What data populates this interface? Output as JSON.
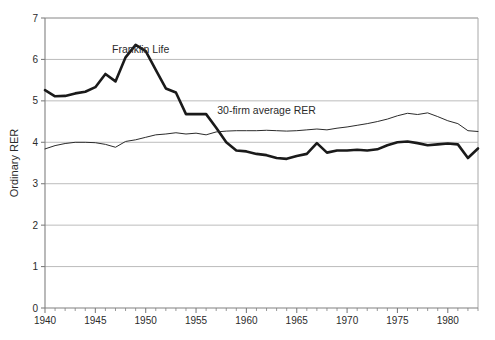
{
  "chart_data": {
    "type": "line",
    "title": "",
    "xlabel": "",
    "ylabel": "Ordinary RER",
    "xlim": [
      1940,
      1983
    ],
    "ylim": [
      0,
      7
    ],
    "grid": "horizontal",
    "legend_position": "inline-annotations",
    "xticks": [
      1940,
      1945,
      1950,
      1955,
      1960,
      1965,
      1970,
      1975,
      1980
    ],
    "yticks": [
      0,
      1,
      2,
      3,
      4,
      5,
      6,
      7
    ],
    "x": [
      1940,
      1941,
      1942,
      1943,
      1944,
      1945,
      1946,
      1947,
      1948,
      1949,
      1950,
      1951,
      1952,
      1953,
      1954,
      1955,
      1956,
      1957,
      1958,
      1959,
      1960,
      1961,
      1962,
      1963,
      1964,
      1965,
      1966,
      1967,
      1968,
      1969,
      1970,
      1971,
      1972,
      1973,
      1974,
      1975,
      1976,
      1977,
      1978,
      1979,
      1980,
      1981,
      1982,
      1983
    ],
    "series": [
      {
        "name": "Franklin Life",
        "label": "Franklin Life",
        "color": "#1a1a1a",
        "line_width": 2.6,
        "label_x": 1949.5,
        "label_y": 6.15,
        "values": [
          5.26,
          5.11,
          5.12,
          5.18,
          5.22,
          5.33,
          5.65,
          5.47,
          6.05,
          6.35,
          6.2,
          5.75,
          5.3,
          5.2,
          4.68,
          4.68,
          4.68,
          4.35,
          4.0,
          3.8,
          3.78,
          3.72,
          3.69,
          3.62,
          3.6,
          3.67,
          3.72,
          3.98,
          3.75,
          3.8,
          3.8,
          3.82,
          3.8,
          3.83,
          3.93,
          4.0,
          4.02,
          3.98,
          3.93,
          3.95,
          3.97,
          3.95,
          3.62,
          3.85
        ]
      },
      {
        "name": "30-firm average RER",
        "label": "30-firm average RER",
        "color": "#2b2b2b",
        "line_width": 1.0,
        "label_x": 1962.0,
        "label_y": 4.68,
        "values": [
          3.84,
          3.92,
          3.97,
          4.0,
          4.0,
          3.99,
          3.95,
          3.88,
          4.02,
          4.06,
          4.12,
          4.18,
          4.2,
          4.23,
          4.2,
          4.22,
          4.18,
          4.25,
          4.27,
          4.28,
          4.28,
          4.28,
          4.29,
          4.28,
          4.27,
          4.28,
          4.3,
          4.32,
          4.3,
          4.34,
          4.37,
          4.41,
          4.45,
          4.5,
          4.56,
          4.64,
          4.7,
          4.67,
          4.71,
          4.62,
          4.52,
          4.45,
          4.28,
          4.26
        ]
      }
    ]
  },
  "axis": {
    "y_label": "Ordinary RER",
    "y_tick_labels": [
      "7",
      "6",
      "5",
      "4",
      "3",
      "2",
      "1",
      "0"
    ],
    "x_tick_labels": [
      "1940",
      "1945",
      "1950",
      "1955",
      "1960",
      "1965",
      "1970",
      "1975",
      "1980"
    ]
  },
  "annotations": {
    "franklin_life": "Franklin Life",
    "thirty_firm": "30-firm average RER"
  },
  "colors": {
    "background": "#ffffff",
    "grid": "#b4b4b4",
    "axis": "#808080",
    "frame": "#a8a8a8",
    "bold_series": "#1a1a1a",
    "thin_series": "#2b2b2b",
    "text": "#2b2b2b"
  }
}
